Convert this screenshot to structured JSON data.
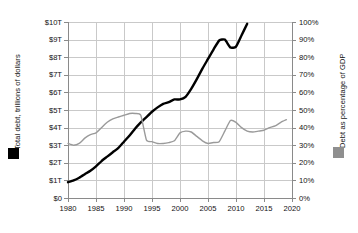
{
  "chart_data": {
    "type": "line",
    "title": "",
    "xlabel": "",
    "ylabel": "Total debt, trillions of dollars",
    "y2label": "Debt as percentage of GDP",
    "grid": true,
    "legend_position": "outside-left-and-right",
    "xlim": [
      1980,
      2020
    ],
    "ylim": [
      0,
      10
    ],
    "y2lim": [
      0,
      100
    ],
    "x_ticks": [
      "1980",
      "1985",
      "1990",
      "1995",
      "2000",
      "2005",
      "2010",
      "2015",
      "2020"
    ],
    "x_tick_values": [
      1980,
      1985,
      1990,
      1995,
      2000,
      2005,
      2010,
      2015,
      2020
    ],
    "y_left_ticks": [
      "$0",
      "$1T",
      "$2T",
      "$3T",
      "$4T",
      "$5T",
      "$6T",
      "$7T",
      "$8T",
      "$9T",
      "$10T"
    ],
    "y_left_tick_values": [
      0,
      1,
      2,
      3,
      4,
      5,
      6,
      7,
      8,
      9,
      10
    ],
    "y_right_ticks": [
      "0%",
      "10%",
      "20%",
      "30%",
      "40%",
      "50%",
      "60%",
      "70%",
      "80%",
      "90%",
      "100%"
    ],
    "y_right_tick_values": [
      0,
      10,
      20,
      30,
      40,
      50,
      60,
      70,
      80,
      90,
      100
    ],
    "colors": {
      "total_debt": "#000000",
      "debt_pct_gdp": "#9a9a9a",
      "grid": "#c9c9c9",
      "axis": "#8a8a8a",
      "text": "#111111",
      "background": "#ffffff"
    },
    "series": [
      {
        "name": "Total debt, trillions of dollars",
        "axis": "left",
        "color": "#000000",
        "units": "trillions of dollars",
        "x": [
          1980,
          1981,
          1982,
          1983,
          1984,
          1985,
          1986,
          1987,
          1988,
          1989,
          1990,
          1991,
          1992,
          1993,
          1994,
          1995,
          1996,
          1997,
          1998,
          1999,
          2000,
          2001,
          2002,
          2003,
          2004,
          2005,
          2006,
          2007,
          2008,
          2009,
          2010,
          2011,
          2012,
          2013,
          2014,
          2015,
          2016,
          2017,
          2018,
          2019
        ],
        "values": [
          0.91,
          0.99,
          1.14,
          1.37,
          1.56,
          1.82,
          2.12,
          2.35,
          2.6,
          2.86,
          3.2,
          3.6,
          4.0,
          4.35,
          4.64,
          4.92,
          5.18,
          5.37,
          5.48,
          5.6,
          5.62,
          5.77,
          6.2,
          6.76,
          7.35,
          7.9,
          8.45,
          8.95,
          9.0,
          8.55,
          8.6,
          9.25,
          9.9,
          10.6,
          11.3,
          11.9,
          12.6,
          13.4,
          14.3,
          15.1
        ],
        "display_values": [
          0.9,
          1.0,
          1.15,
          1.35,
          1.55,
          1.8,
          2.1,
          2.35,
          2.6,
          2.85,
          3.2,
          3.55,
          3.95,
          4.3,
          4.6,
          4.9,
          5.15,
          5.35,
          5.45,
          5.6,
          5.6,
          5.75,
          6.2,
          6.75,
          7.35,
          7.9,
          8.45,
          8.95,
          9.0,
          8.55,
          8.6,
          9.25,
          9.9,
          10.6,
          11.3,
          11.9,
          12.6,
          13.4,
          14.3,
          15.1
        ]
      },
      {
        "name": "Debt as percentage of GDP",
        "axis": "right",
        "color": "#9a9a9a",
        "units": "percent",
        "x": [
          1980,
          1981,
          1982,
          1983,
          1984,
          1985,
          1986,
          1987,
          1988,
          1989,
          1990,
          1991,
          1992,
          1993,
          1994,
          1995,
          1996,
          1997,
          1998,
          1999,
          2000,
          2001,
          2002,
          2003,
          2004,
          2005,
          2006,
          2007,
          2008,
          2009,
          2010,
          2011,
          2012,
          2013,
          2014,
          2015,
          2016,
          2017,
          2018,
          2019
        ],
        "values": [
          31,
          30,
          31,
          34,
          36,
          37,
          40,
          43,
          45,
          46,
          47,
          48,
          48,
          47,
          33,
          32,
          31,
          31,
          31.5,
          32.5,
          37,
          38,
          37.5,
          35,
          32.5,
          31,
          31.5,
          32,
          38,
          44,
          43,
          40,
          38,
          37.5,
          38,
          38.5,
          40,
          41,
          43,
          44.5
        ]
      }
    ],
    "annotations": []
  },
  "legend": {
    "left": {
      "label": "Total debt, trillions of dollars",
      "swatch_color": "#000000",
      "swatch_name": "black-square-swatch"
    },
    "right": {
      "label": "Debt as percentage of GDP",
      "swatch_color": "#8f8f8f",
      "swatch_name": "gray-square-swatch"
    }
  }
}
